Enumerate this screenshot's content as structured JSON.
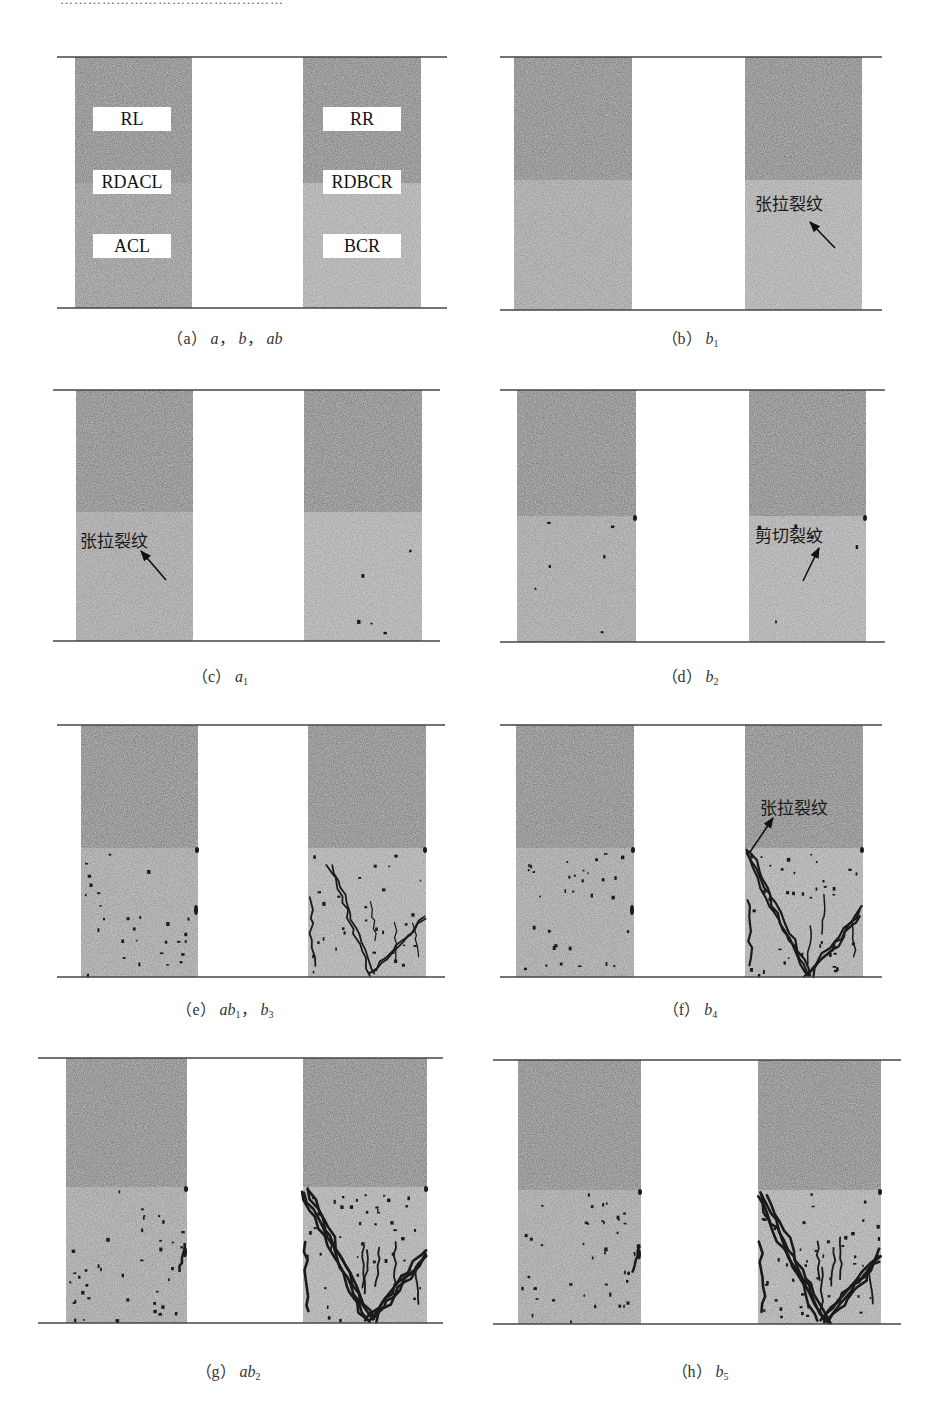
{
  "figure": {
    "header_fragment": "…………………………………………",
    "colors": {
      "upper_region": "#8a8a8a",
      "lower_region": "#a9a9a9",
      "lower_region_b": "#b4b4b4",
      "rule": "#444444",
      "crack": "#1a1a1a",
      "label_bg": "#ffffff"
    },
    "panels": [
      {
        "id": "a",
        "caption_prefix": "(a)",
        "caption_parts": [
          {
            "t": "a",
            "s": ""
          },
          {
            "t": "，",
            "s": "",
            "plain": true
          },
          {
            "t": "b",
            "s": ""
          },
          {
            "t": "，",
            "s": "",
            "plain": true
          },
          {
            "t": "ab",
            "s": ""
          }
        ],
        "left_labels": [
          "RL",
          "RDACL",
          "ACL"
        ],
        "right_labels": [
          "RR",
          "RDBCR",
          "BCR"
        ],
        "annotation": null,
        "crack_level": 0
      },
      {
        "id": "b",
        "caption_prefix": "(b)",
        "caption_parts": [
          {
            "t": "b",
            "s": "1"
          }
        ],
        "annotation": {
          "text": "张拉裂纹",
          "column": "right",
          "type": "tension"
        },
        "crack_level": 0
      },
      {
        "id": "c",
        "caption_prefix": "(c)",
        "caption_parts": [
          {
            "t": "a",
            "s": "1"
          }
        ],
        "annotation": {
          "text": "张拉裂纹",
          "column": "left",
          "type": "tension"
        },
        "crack_level": 1
      },
      {
        "id": "d",
        "caption_prefix": "(d)",
        "caption_parts": [
          {
            "t": "b",
            "s": "2"
          }
        ],
        "annotation": {
          "text": "剪切裂纹",
          "column": "right",
          "type": "shear"
        },
        "crack_level": 2
      },
      {
        "id": "e",
        "caption_prefix": "(e)",
        "caption_parts": [
          {
            "t": "ab",
            "s": "1"
          },
          {
            "t": "，",
            "s": "",
            "plain": true
          },
          {
            "t": "b",
            "s": "3"
          }
        ],
        "annotation": null,
        "crack_level": 3
      },
      {
        "id": "f",
        "caption_prefix": "(f)",
        "caption_parts": [
          {
            "t": "b",
            "s": "4"
          }
        ],
        "annotation": {
          "text": "张拉裂纹",
          "column": "right",
          "type": "tension"
        },
        "crack_level": 4
      },
      {
        "id": "g",
        "caption_prefix": "(g)",
        "caption_parts": [
          {
            "t": "ab",
            "s": "2"
          }
        ],
        "annotation": null,
        "crack_level": 5
      },
      {
        "id": "h",
        "caption_prefix": "(h)",
        "caption_parts": [
          {
            "t": "b",
            "s": "5"
          }
        ],
        "annotation": null,
        "crack_level": 5
      }
    ],
    "region_legend": {
      "RL": "left rock (upper-left)",
      "RR": "right rock (upper-right)",
      "RDACL": "interface left",
      "RDBCR": "interface right",
      "ACL": "lower-left",
      "BCR": "lower-right"
    }
  }
}
